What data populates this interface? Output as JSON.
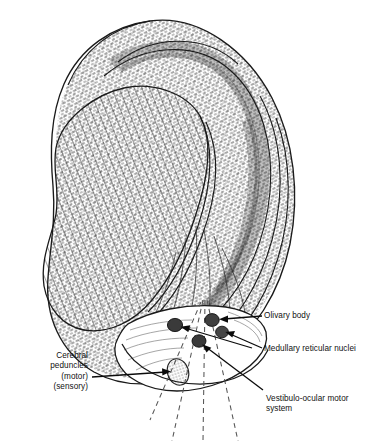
{
  "figure": {
    "name": "brainstem-sagittal-illustration",
    "style": "pen-and-ink anatomical line drawing",
    "background_color": "#ffffff",
    "ink_color": "#1a1a1a",
    "label_color": "#111111"
  },
  "labels": {
    "cerebral_peduncles": "Cerebral\npeduncles\n(motor)\n(sensory)",
    "olivary_body": "Olivary body",
    "medullary_reticular_nuclei": "Medullary reticular nuclei",
    "vestibulo_ocular": "Vestibulo-ocular motor\nsystem"
  },
  "structures": [
    {
      "id": "cut-surface-hatched",
      "label": "hatched cut surface of cerebrum",
      "fill": "diagonal-hatching"
    },
    {
      "id": "cerebral-hemisphere",
      "label": "cerebral hemisphere",
      "fill": "dense-stipple-hatching"
    },
    {
      "id": "brainstem",
      "label": "brainstem cut surface",
      "fill": "outline"
    },
    {
      "id": "cerebral-peduncle-nucleus",
      "label": "cerebral peduncle",
      "fill": "stipple-oval"
    },
    {
      "id": "olivary-body-nucleus",
      "label": "olivary body",
      "fill": "dark-blob"
    },
    {
      "id": "medullary-reticular-nucleus",
      "label": "medullary reticular nuclei",
      "fill": "dark-blob"
    },
    {
      "id": "vestibulo-ocular-nucleus",
      "label": "vestibulo-ocular motor system",
      "fill": "dark-blob"
    }
  ]
}
